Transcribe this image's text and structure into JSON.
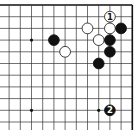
{
  "board": {
    "size_visible_cols": 12,
    "size_visible_rows": 11,
    "edges": [
      "top",
      "right"
    ],
    "origin_x": 132.3,
    "origin_y": 5,
    "step_x": 11.2,
    "step_y": 11.7,
    "line_color": "#333333",
    "edge_color": "#111111",
    "background": "#ffffff"
  },
  "hoshi": [
    {
      "col": 3,
      "row": 3
    },
    {
      "col": 9,
      "row": 3
    },
    {
      "col": 3,
      "row": 9
    },
    {
      "col": 9,
      "row": 9
    }
  ],
  "stones": [
    {
      "color": "white",
      "col": 2,
      "row": 1,
      "label": "1"
    },
    {
      "color": "white",
      "col": 4,
      "row": 2,
      "label": ""
    },
    {
      "color": "white",
      "col": 2,
      "row": 2,
      "label": ""
    },
    {
      "color": "black",
      "col": 1,
      "row": 2,
      "label": ""
    },
    {
      "color": "black",
      "col": 7,
      "row": 3,
      "label": ""
    },
    {
      "color": "white",
      "col": 3,
      "row": 3,
      "label": ""
    },
    {
      "color": "black",
      "col": 2,
      "row": 3,
      "label": ""
    },
    {
      "color": "white",
      "col": 6,
      "row": 4,
      "label": ""
    },
    {
      "color": "black",
      "col": 2,
      "row": 4,
      "label": ""
    },
    {
      "color": "black",
      "col": 3,
      "row": 5,
      "label": ""
    },
    {
      "color": "black",
      "col": 2,
      "row": 9,
      "label": "2"
    }
  ],
  "colors": {
    "black_stone": "#111111",
    "white_stone": "#ffffff",
    "white_stroke": "#111111",
    "label_on_black": "#ffffff",
    "label_on_white": "#111111"
  }
}
